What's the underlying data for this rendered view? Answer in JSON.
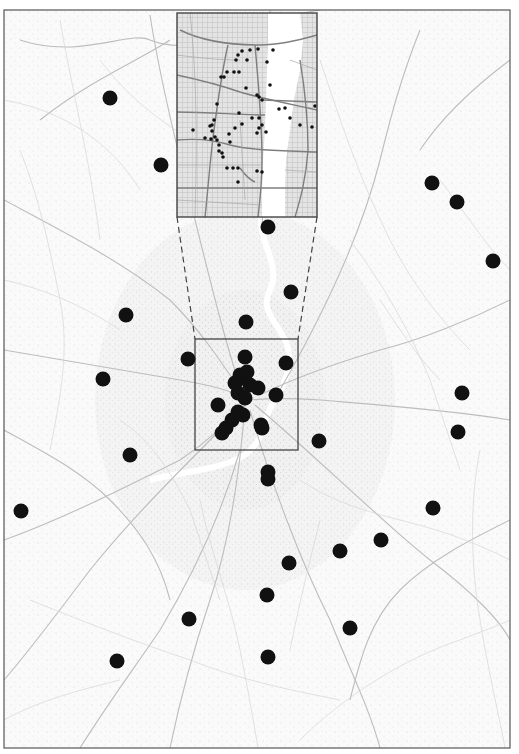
{
  "figure": {
    "type": "map",
    "colors": {
      "background": "#ffffff",
      "map_base": "#f7f7f7",
      "road_minor": "#d4d4d4",
      "road_major": "#b8b8b8",
      "frame": "#555555",
      "marker": "#111111",
      "river": "#ffffff",
      "inset_base": "#dcdcdc",
      "inset_road": "#8a8a8a"
    },
    "outer_frame": {
      "x": 4,
      "y": 10,
      "w": 506,
      "h": 738
    },
    "zoom_box": {
      "x": 195,
      "y": 339,
      "w": 103,
      "h": 111
    },
    "inset": {
      "x": 177,
      "y": 13,
      "w": 140,
      "h": 204
    },
    "connectors": [
      {
        "x1": 177,
        "y1": 217,
        "x2": 195,
        "y2": 339
      },
      {
        "x1": 317,
        "y1": 217,
        "x2": 298,
        "y2": 339
      }
    ],
    "large_markers": [
      [
        110,
        98
      ],
      [
        161,
        165
      ],
      [
        432,
        183
      ],
      [
        457,
        202
      ],
      [
        268,
        227
      ],
      [
        493,
        261
      ],
      [
        291,
        292
      ],
      [
        126,
        315
      ],
      [
        246,
        322
      ],
      [
        188,
        359
      ],
      [
        103,
        379
      ],
      [
        462,
        393
      ],
      [
        458,
        432
      ],
      [
        319,
        441
      ],
      [
        130,
        455
      ],
      [
        268,
        472
      ],
      [
        268,
        479
      ],
      [
        21,
        511
      ],
      [
        433,
        508
      ],
      [
        381,
        540
      ],
      [
        340,
        551
      ],
      [
        289,
        563
      ],
      [
        267,
        595
      ],
      [
        189,
        619
      ],
      [
        350,
        628
      ],
      [
        117,
        661
      ],
      [
        268,
        657
      ],
      [
        245,
        357
      ],
      [
        286,
        363
      ],
      [
        242,
        378
      ],
      [
        235,
        383
      ],
      [
        250,
        385
      ],
      [
        258,
        388
      ],
      [
        238,
        393
      ],
      [
        245,
        398
      ],
      [
        240,
        375
      ],
      [
        247,
        372
      ],
      [
        276,
        395
      ],
      [
        218,
        405
      ],
      [
        238,
        412
      ],
      [
        243,
        415
      ],
      [
        226,
        428
      ],
      [
        222,
        433
      ],
      [
        261,
        425
      ],
      [
        262,
        428
      ],
      [
        232,
        420
      ]
    ],
    "small_markers": [
      [
        273,
        50
      ],
      [
        258,
        49
      ],
      [
        250,
        50
      ],
      [
        242,
        51
      ],
      [
        238,
        55
      ],
      [
        236,
        60
      ],
      [
        247,
        60
      ],
      [
        227,
        72
      ],
      [
        224,
        77
      ],
      [
        221,
        77
      ],
      [
        234,
        72
      ],
      [
        246,
        88
      ],
      [
        239,
        72
      ],
      [
        267,
        62
      ],
      [
        270,
        85
      ],
      [
        257,
        95
      ],
      [
        259,
        97
      ],
      [
        262,
        100
      ],
      [
        279,
        109
      ],
      [
        285,
        108
      ],
      [
        315,
        106
      ],
      [
        290,
        118
      ],
      [
        217,
        104
      ],
      [
        214,
        120
      ],
      [
        212,
        125
      ],
      [
        210,
        126
      ],
      [
        193,
        130
      ],
      [
        205,
        138
      ],
      [
        211,
        139
      ],
      [
        239,
        113
      ],
      [
        252,
        118
      ],
      [
        259,
        118
      ],
      [
        262,
        125
      ],
      [
        259,
        128
      ],
      [
        242,
        124
      ],
      [
        235,
        128
      ],
      [
        229,
        134
      ],
      [
        230,
        142
      ],
      [
        212,
        131
      ],
      [
        215,
        137
      ],
      [
        217,
        140
      ],
      [
        219,
        145
      ],
      [
        222,
        153
      ],
      [
        223,
        157
      ],
      [
        219,
        151
      ],
      [
        227,
        168
      ],
      [
        233,
        168
      ],
      [
        238,
        168
      ],
      [
        257,
        133
      ],
      [
        266,
        132
      ],
      [
        257,
        171
      ],
      [
        262,
        172
      ],
      [
        238,
        182
      ],
      [
        300,
        125
      ],
      [
        312,
        127
      ]
    ]
  }
}
